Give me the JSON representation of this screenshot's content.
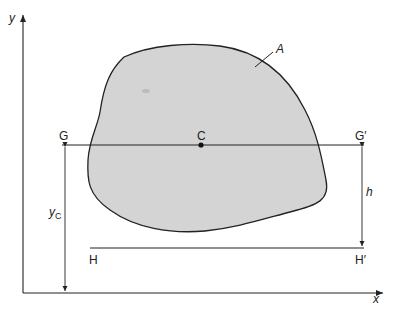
{
  "figure": {
    "axes": {
      "x_label": "x",
      "y_label": "y"
    },
    "area_label": "A",
    "centroid_label": "C",
    "line_through_centroid": {
      "left_label": "G",
      "right_label": "G′"
    },
    "parallel_line": {
      "left_label": "H",
      "right_label": "H′"
    },
    "dimensions": {
      "centroid_height": "y",
      "centroid_height_subscript": "C",
      "separation": "h"
    },
    "colors": {
      "shape_fill": "#d4d4d4",
      "stroke": "#222222",
      "background": "#ffffff"
    }
  }
}
